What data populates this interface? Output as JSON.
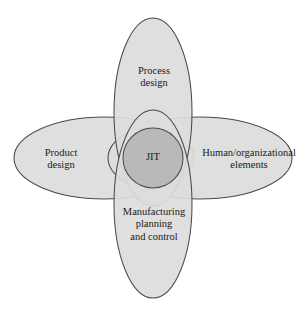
{
  "figure": {
    "background_color": "#ffffff",
    "lobe_fill_color": "#dcdcdc",
    "center_fill_color": "#b9b9b9",
    "outline_color": "#4a4a4a",
    "text_color": "#1a1a1a"
  },
  "center": {
    "label": "JIT"
  },
  "lobes": {
    "top": {
      "label": "Process\ndesign",
      "position": "top"
    },
    "left": {
      "label": "Product\ndesign",
      "position": "left"
    },
    "right": {
      "label": "Human/organizational\nelements",
      "position": "right"
    },
    "bottom": {
      "label": "Manufacturing\nplanning\nand control",
      "position": "bottom"
    }
  }
}
